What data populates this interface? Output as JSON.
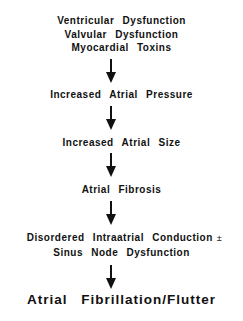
{
  "diagram": {
    "type": "flowchart",
    "direction": "top-to-bottom",
    "nodes": [
      {
        "id": "causes",
        "lines": [
          "Ventricular Dysfunction",
          "Valvular Dysfunction",
          "Myocardial Toxins"
        ]
      },
      {
        "id": "pressure",
        "lines": [
          "Increased Atrial Pressure"
        ]
      },
      {
        "id": "size",
        "lines": [
          "Increased Atrial Size"
        ]
      },
      {
        "id": "fibrosis",
        "lines": [
          "Atrial Fibrosis"
        ]
      },
      {
        "id": "conduction",
        "lines": [
          "Disordered Intraatrial Conduction",
          "Sinus Node Dysfunction"
        ],
        "connector": "±"
      },
      {
        "id": "outcome",
        "lines": [
          "Atrial Fibrillation/Flutter"
        ]
      }
    ],
    "edges": [
      {
        "from": "causes",
        "to": "pressure"
      },
      {
        "from": "pressure",
        "to": "size"
      },
      {
        "from": "size",
        "to": "fibrosis"
      },
      {
        "from": "fibrosis",
        "to": "conduction"
      },
      {
        "from": "conduction",
        "to": "outcome"
      }
    ],
    "colors": {
      "text": "#111111",
      "arrow": "#111111",
      "background": "#ffffff"
    }
  }
}
